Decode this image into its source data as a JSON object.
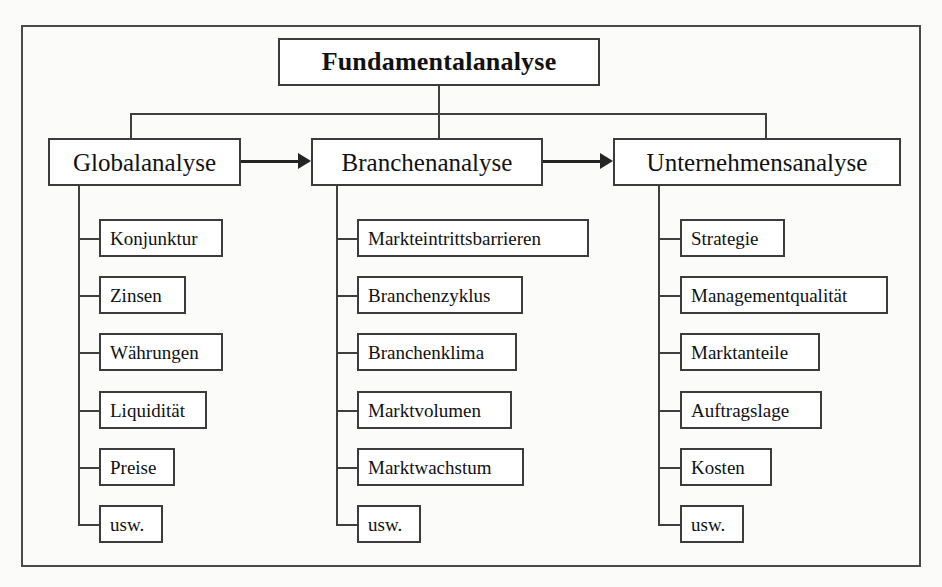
{
  "diagram": {
    "title": "Fundamentalanalyse",
    "branches": [
      {
        "name": "Globalanalyse",
        "items": [
          "Konjunktur",
          "Zinsen",
          "Währungen",
          "Liquidität",
          "Preise",
          "usw."
        ]
      },
      {
        "name": "Branchenanalyse",
        "items": [
          "Markteintrittsbarrieren",
          "Branchenzyklus",
          "Branchenklima",
          "Marktvolumen",
          "Marktwachstum",
          "usw."
        ]
      },
      {
        "name": "Unternehmensanalyse",
        "items": [
          "Strategie",
          "Managementqualität",
          "Marktanteile",
          "Auftragslage",
          "Kosten",
          "usw."
        ]
      }
    ],
    "colors": {
      "page_background": "#fbfbfa",
      "frame_border": "#4a4a4a",
      "box_border": "#3c3c3c",
      "box_fill": "#ffffff",
      "connector": "#3f3f3f",
      "arrow": "#242424",
      "text": "#111111"
    }
  }
}
